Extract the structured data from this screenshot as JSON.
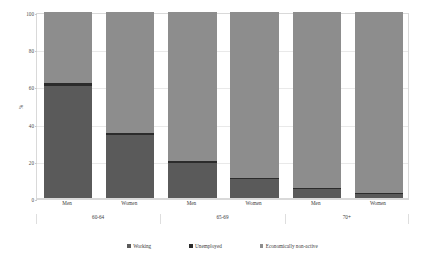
{
  "chart_data": {
    "type": "bar",
    "subtype": "stacked-100-percent-column",
    "title": "",
    "xlabel": "",
    "ylabel": "%",
    "ylim": [
      0,
      100
    ],
    "yticks": [
      0,
      20,
      40,
      60,
      80,
      100
    ],
    "ytick_labels": [
      "0",
      "20",
      "40",
      "60",
      "80",
      "100"
    ],
    "grid": true,
    "legend_position": "bottom",
    "groups": [
      "60-64",
      "65-69",
      "70+"
    ],
    "categories": [
      "Men",
      "Women",
      "Men",
      "Women",
      "Men",
      "Women"
    ],
    "category_groups": [
      "60-64",
      "60-64",
      "65-69",
      "65-69",
      "70+",
      "70+"
    ],
    "series": [
      {
        "name": "Working",
        "color": "#5a5a5a",
        "values": [
          60,
          34,
          19,
          10,
          5,
          2
        ]
      },
      {
        "name": "Unemployed",
        "color": "#2b2b2b",
        "values": [
          2,
          1,
          1,
          1,
          0.6,
          0.5
        ]
      },
      {
        "name": "Economically non-active",
        "color": "#8d8d8d",
        "values": [
          38,
          65,
          80,
          89,
          94.4,
          97.5
        ]
      }
    ]
  },
  "axis": {
    "y_title": "%",
    "ticks": [
      {
        "label": "100",
        "value": 100
      },
      {
        "label": "80",
        "value": 80
      },
      {
        "label": "60",
        "value": 60
      },
      {
        "label": "40",
        "value": 40
      },
      {
        "label": "20",
        "value": 20
      },
      {
        "label": "0",
        "value": 0
      }
    ]
  },
  "categories": [
    {
      "label": "Men"
    },
    {
      "label": "Women"
    },
    {
      "label": "Men"
    },
    {
      "label": "Women"
    },
    {
      "label": "Men"
    },
    {
      "label": "Women"
    }
  ],
  "groups": [
    {
      "label": "60-64"
    },
    {
      "label": "65-69"
    },
    {
      "label": "70+"
    }
  ],
  "legend": {
    "items": [
      {
        "label": "Working",
        "color": "#5a5a5a"
      },
      {
        "label": "Unemployed",
        "color": "#2b2b2b"
      },
      {
        "label": "Economically non-active",
        "color": "#8d8d8d"
      }
    ]
  }
}
